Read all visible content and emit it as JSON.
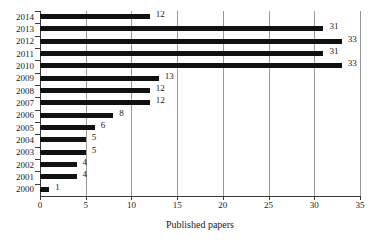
{
  "chart_data": {
    "type": "bar",
    "orientation": "horizontal",
    "title": "",
    "subtitle": "",
    "xlabel": "Published papers",
    "ylabel": "",
    "categories": [
      "2014",
      "2013",
      "2012",
      "2011",
      "2010",
      "2009",
      "2008",
      "2007",
      "2006",
      "2005",
      "2004",
      "2003",
      "2002",
      "2001",
      "2000"
    ],
    "values": [
      12,
      31,
      33,
      31,
      33,
      13,
      12,
      12,
      8,
      6,
      5,
      5,
      4,
      4,
      1
    ],
    "data_labels": [
      "12",
      "31",
      "33",
      "31",
      "33",
      "13",
      "12",
      "12",
      "8",
      "6",
      "5",
      "5",
      "4",
      "4",
      "1"
    ],
    "xlim": [
      0,
      35
    ],
    "xticks": [
      0,
      5,
      10,
      15,
      20,
      25,
      30,
      35
    ],
    "xtick_labels": [
      "0",
      "5",
      "10",
      "15",
      "20",
      "25",
      "30",
      "35"
    ],
    "grid": true,
    "grid_axis": "x",
    "legend": false,
    "legend_position": "none",
    "bar_color": "#111111",
    "grid_color": "#9a9a9a",
    "axis_color": "#3a3a3a",
    "background_color": "#ffffff"
  },
  "axis": {
    "x_title": "Published papers"
  }
}
